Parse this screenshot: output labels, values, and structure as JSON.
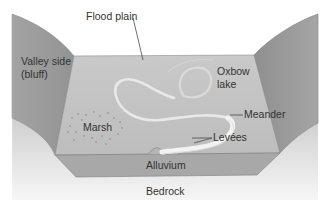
{
  "diagram": {
    "type": "cross-section",
    "labels": {
      "flood_plain": "Flood plain",
      "valley_side_line1": "Valley side",
      "valley_side_line2": "(bluff)",
      "oxbow_line1": "Oxbow",
      "oxbow_line2": "lake",
      "meander": "Meander",
      "levees": "Levées",
      "marsh": "Marsh",
      "alluvium": "Alluvium",
      "bedrock": "Bedrock"
    },
    "colors": {
      "valley_side": "#9c9c9c",
      "flood_plain_surface": "#c4c4c4",
      "alluvium": "#a9a9a9",
      "bedrock_top": "#d0d0d0",
      "bedrock_bottom": "#f4f4f4",
      "river": "#f2f2f2",
      "edge": "#7a7a7a"
    }
  }
}
